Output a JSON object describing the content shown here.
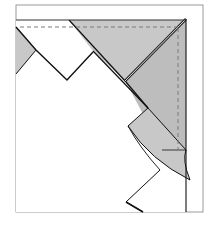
{
  "diagram": {
    "type": "origami-fold-step",
    "colors": {
      "background": "#ffffff",
      "frame": "#9a9a9a",
      "paper_white": "#ffffff",
      "paper_gray": "#c8c8c8",
      "paper_gray_dark": "#bdbdbd",
      "line": "#111111",
      "dashed": "#7a7a7a"
    }
  }
}
